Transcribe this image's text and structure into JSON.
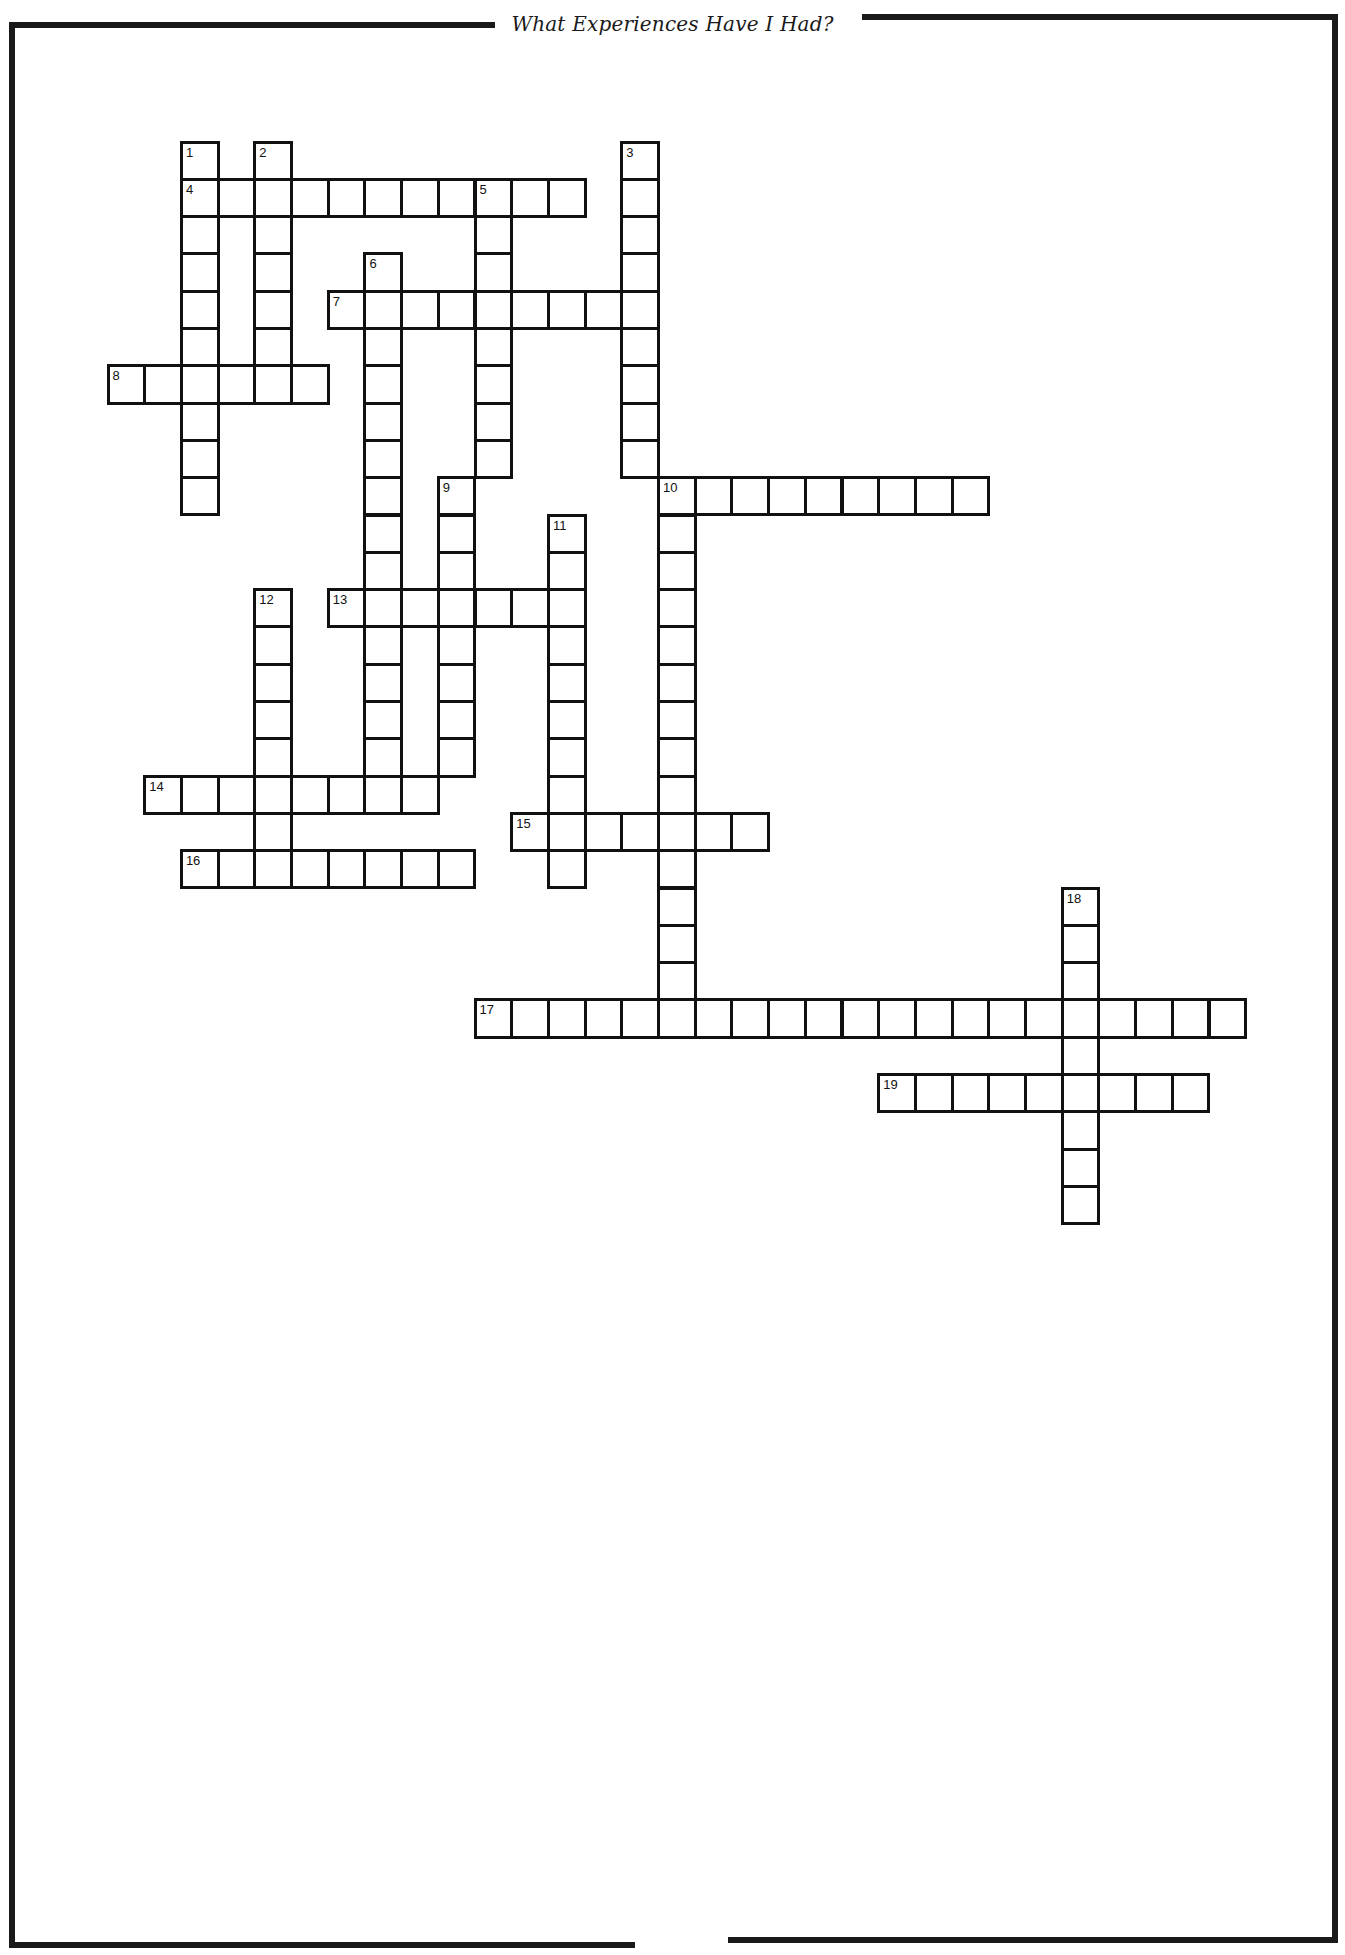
{
  "page": {
    "title": "What Experiences Have I Had?",
    "colors": {
      "ink": "#111111",
      "paper": "#ffffff"
    }
  },
  "grid": {
    "origin_x": 108,
    "origin_y": 142,
    "cell_w": 36.7,
    "cell_h": 37.3,
    "entries": [
      {
        "number": "1",
        "direction": "down",
        "row": 0,
        "col": 2,
        "length": 10
      },
      {
        "number": "2",
        "direction": "down",
        "row": 0,
        "col": 4,
        "length": 7
      },
      {
        "number": "3",
        "direction": "down",
        "row": 0,
        "col": 14,
        "length": 9
      },
      {
        "number": "4",
        "direction": "across",
        "row": 1,
        "col": 2,
        "length": 11
      },
      {
        "number": "5",
        "direction": "down",
        "row": 1,
        "col": 10,
        "length": 8
      },
      {
        "number": "6",
        "direction": "down",
        "row": 3,
        "col": 7,
        "length": 15
      },
      {
        "number": "7",
        "direction": "across",
        "row": 4,
        "col": 6,
        "length": 9
      },
      {
        "number": "8",
        "direction": "across",
        "row": 6,
        "col": 0,
        "length": 6
      },
      {
        "number": "9",
        "direction": "down",
        "row": 9,
        "col": 9,
        "length": 8
      },
      {
        "number": "10",
        "direction": "across",
        "row": 9,
        "col": 15,
        "length": 9
      },
      {
        "number": "10",
        "direction": "down",
        "row": 9,
        "col": 15,
        "length": 15
      },
      {
        "number": "11",
        "direction": "down",
        "row": 10,
        "col": 12,
        "length": 10
      },
      {
        "number": "12",
        "direction": "down",
        "row": 12,
        "col": 4,
        "length": 8
      },
      {
        "number": "13",
        "direction": "across",
        "row": 12,
        "col": 6,
        "length": 7
      },
      {
        "number": "14",
        "direction": "across",
        "row": 17,
        "col": 1,
        "length": 8
      },
      {
        "number": "15",
        "direction": "across",
        "row": 18,
        "col": 11,
        "length": 7
      },
      {
        "number": "16",
        "direction": "across",
        "row": 19,
        "col": 2,
        "length": 8
      },
      {
        "number": "17",
        "direction": "across",
        "row": 23,
        "col": 10,
        "length": 21
      },
      {
        "number": "18",
        "direction": "down",
        "row": 20,
        "col": 26,
        "length": 9
      },
      {
        "number": "19",
        "direction": "across",
        "row": 25,
        "col": 21,
        "length": 9
      }
    ]
  }
}
